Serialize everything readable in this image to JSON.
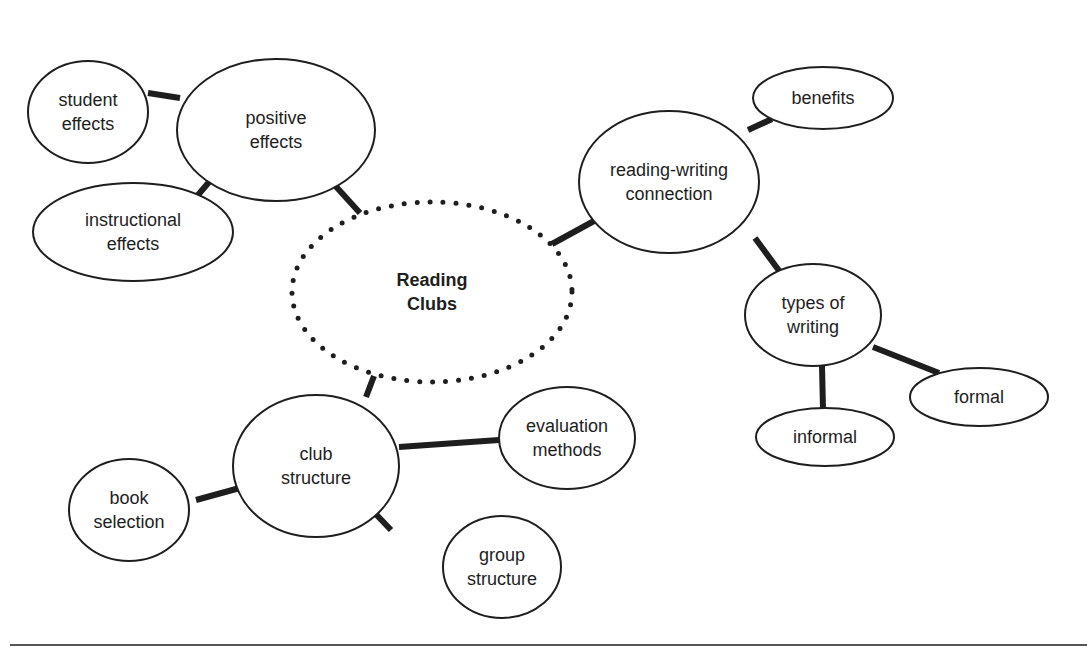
{
  "diagram": {
    "title": "Reading Clubs",
    "type": "concept-map",
    "colors": {
      "stroke": "#1e1e1e",
      "text": "#1e1e1e",
      "background": "#ffffff",
      "rule": "#555555"
    },
    "nodes": [
      {
        "id": "reading-clubs",
        "lines": [
          "Reading",
          "Clubs"
        ],
        "cx": 432,
        "cy": 292,
        "rx": 140,
        "ry": 90,
        "style": "dotted",
        "central": true
      },
      {
        "id": "positive-effects",
        "lines": [
          "positive",
          "effects"
        ],
        "cx": 276,
        "cy": 130,
        "rx": 99,
        "ry": 71
      },
      {
        "id": "student-effects",
        "lines": [
          "student",
          "effects"
        ],
        "cx": 88,
        "cy": 112,
        "rx": 60,
        "ry": 51
      },
      {
        "id": "instructional-effects",
        "lines": [
          "instructional",
          "effects"
        ],
        "cx": 133,
        "cy": 232,
        "rx": 100,
        "ry": 49
      },
      {
        "id": "reading-writing-connection",
        "lines": [
          "reading-writing",
          "connection"
        ],
        "cx": 669,
        "cy": 182,
        "rx": 90,
        "ry": 71
      },
      {
        "id": "benefits",
        "lines": [
          "benefits"
        ],
        "cx": 823,
        "cy": 98,
        "rx": 70,
        "ry": 31
      },
      {
        "id": "types-of-writing",
        "lines": [
          "types of",
          "writing"
        ],
        "cx": 813,
        "cy": 315,
        "rx": 68,
        "ry": 51
      },
      {
        "id": "formal",
        "lines": [
          "formal"
        ],
        "cx": 979,
        "cy": 397,
        "rx": 69,
        "ry": 29
      },
      {
        "id": "informal",
        "lines": [
          "informal"
        ],
        "cx": 825,
        "cy": 437,
        "rx": 69,
        "ry": 29
      },
      {
        "id": "club-structure",
        "lines": [
          "club",
          "structure"
        ],
        "cx": 316,
        "cy": 466,
        "rx": 83,
        "ry": 71
      },
      {
        "id": "evaluation-methods",
        "lines": [
          "evaluation",
          "methods"
        ],
        "cx": 567,
        "cy": 438,
        "rx": 68,
        "ry": 51
      },
      {
        "id": "book-selection",
        "lines": [
          "book",
          "selection"
        ],
        "cx": 129,
        "cy": 510,
        "rx": 60,
        "ry": 51
      },
      {
        "id": "group-structure",
        "lines": [
          "group",
          "structure"
        ],
        "cx": 502,
        "cy": 567,
        "rx": 59,
        "ry": 51
      }
    ],
    "edges": [
      {
        "from": "reading-clubs",
        "to": "positive-effects",
        "x1": 360,
        "y1": 213,
        "x2": 330,
        "y2": 180
      },
      {
        "from": "positive-effects",
        "to": "student-effects",
        "x1": 180,
        "y1": 98,
        "x2": 148,
        "y2": 93
      },
      {
        "from": "positive-effects",
        "to": "instructional-effects",
        "x1": 215,
        "y1": 175,
        "x2": 198,
        "y2": 195
      },
      {
        "from": "reading-clubs",
        "to": "reading-writing-connection",
        "x1": 552,
        "y1": 244,
        "x2": 594,
        "y2": 221
      },
      {
        "from": "reading-writing-connection",
        "to": "benefits",
        "x1": 748,
        "y1": 130,
        "x2": 772,
        "y2": 119
      },
      {
        "from": "reading-writing-connection",
        "to": "types-of-writing",
        "x1": 755,
        "y1": 238,
        "x2": 780,
        "y2": 272
      },
      {
        "from": "types-of-writing",
        "to": "formal",
        "x1": 873,
        "y1": 347,
        "x2": 939,
        "y2": 373
      },
      {
        "from": "types-of-writing",
        "to": "informal",
        "x1": 822,
        "y1": 366,
        "x2": 823,
        "y2": 409
      },
      {
        "from": "reading-clubs",
        "to": "club-structure",
        "x1": 374,
        "y1": 376,
        "x2": 366,
        "y2": 397
      },
      {
        "from": "club-structure",
        "to": "evaluation-methods",
        "x1": 399,
        "y1": 447,
        "x2": 499,
        "y2": 440
      },
      {
        "from": "club-structure",
        "to": "book-selection",
        "x1": 247,
        "y1": 486,
        "x2": 196,
        "y2": 500
      },
      {
        "from": "club-structure",
        "to": "group-structure",
        "x1": 370,
        "y1": 508,
        "x2": 391,
        "y2": 530
      }
    ]
  },
  "labels": {
    "reading_clubs": [
      "Reading",
      "Clubs"
    ],
    "positive_effects": [
      "positive",
      "effects"
    ],
    "student_effects": [
      "student",
      "effects"
    ],
    "instructional_effects": [
      "instructional",
      "effects"
    ],
    "reading_writing_connection": [
      "reading-writing",
      "connection"
    ],
    "benefits": [
      "benefits"
    ],
    "types_of_writing": [
      "types of",
      "writing"
    ],
    "formal": [
      "formal"
    ],
    "informal": [
      "informal"
    ],
    "club_structure": [
      "club",
      "structure"
    ],
    "evaluation_methods": [
      "evaluation",
      "methods"
    ],
    "book_selection": [
      "book",
      "selection"
    ],
    "group_structure": [
      "group",
      "structure"
    ]
  }
}
